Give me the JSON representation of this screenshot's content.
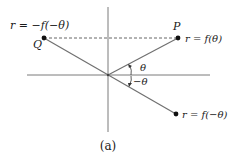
{
  "figure": {
    "caption": "(a)",
    "labels": {
      "q_eq": "r = −f(−θ)",
      "q_point": "Q",
      "p_point": "P",
      "p_eq": "r = f(θ)",
      "theta": "θ",
      "neg_theta": "−θ",
      "lower_eq": "r = f(−θ)"
    },
    "colors": {
      "axis": "#7a7a7a",
      "ray": "#707070",
      "dashed": "#555555",
      "point": "#111111",
      "text": "#1a1a1a"
    },
    "geometry": {
      "origin": [
        108,
        75
      ],
      "Q": [
        44,
        38
      ],
      "P": [
        178,
        38
      ],
      "lower": [
        176,
        114
      ]
    }
  }
}
